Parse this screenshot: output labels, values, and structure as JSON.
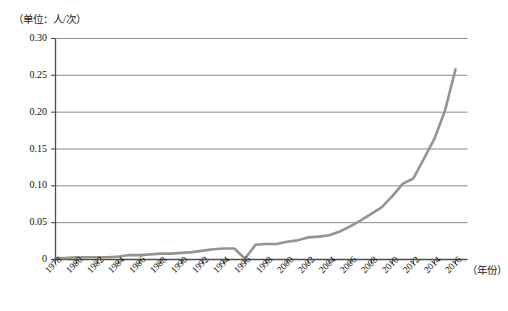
{
  "unit_label": "（单位：人/次）",
  "x_axis_name": "（年份）",
  "colors": {
    "line": "#9a938b",
    "grid": "#6f6f6f",
    "axis": "#4d4d4d",
    "text": "#111111",
    "background": "#ffffff"
  },
  "chart_data": {
    "type": "line",
    "title": "",
    "subtitle": "",
    "xlabel": "（年份）",
    "ylabel": "（单位：人/次）",
    "grid": true,
    "legend": "none",
    "xlim": [
      1978,
      2016
    ],
    "ylim": [
      0,
      0.3
    ],
    "ytick_labels": [
      "0.30",
      "0.25",
      "0.20",
      "0.15",
      "0.10",
      "0.05",
      "0"
    ],
    "ytick_values": [
      0.3,
      0.25,
      0.2,
      0.15,
      0.1,
      0.05,
      0
    ],
    "xtick_labels": [
      "1978",
      "1980",
      "1982",
      "1984",
      "1986",
      "1988",
      "1990",
      "1992",
      "1994",
      "1996",
      "1998",
      "2000",
      "2002",
      "2004",
      "2006",
      "2008",
      "2010",
      "2012",
      "2014",
      "2016"
    ],
    "xtick_values": [
      1978,
      1980,
      1982,
      1984,
      1986,
      1988,
      1990,
      1992,
      1994,
      1996,
      1998,
      2000,
      2002,
      2004,
      2006,
      2008,
      2010,
      2012,
      2014,
      2016
    ],
    "x": [
      1978,
      1979,
      1980,
      1981,
      1982,
      1983,
      1984,
      1985,
      1986,
      1987,
      1988,
      1989,
      1990,
      1991,
      1992,
      1993,
      1994,
      1995,
      1996,
      1997,
      1998,
      1999,
      2000,
      2001,
      2002,
      2003,
      2004,
      2005,
      2006,
      2007,
      2008,
      2009,
      2010,
      2011,
      2012,
      2013,
      2014,
      2015,
      2016
    ],
    "series": [
      {
        "name": "人均出境人次",
        "values": [
          0.002,
          0.002,
          0.003,
          0.003,
          0.003,
          0.003,
          0.004,
          0.006,
          0.006,
          0.007,
          0.008,
          0.008,
          0.009,
          0.01,
          0.012,
          0.014,
          0.015,
          0.015,
          0.001,
          0.02,
          0.021,
          0.021,
          0.024,
          0.026,
          0.03,
          0.031,
          0.033,
          0.038,
          0.045,
          0.053,
          0.062,
          0.071,
          0.086,
          0.103,
          0.11,
          0.137,
          0.164,
          0.202,
          0.258
        ]
      }
    ]
  }
}
